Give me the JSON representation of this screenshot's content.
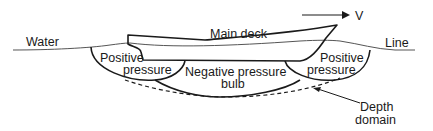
{
  "diagram": {
    "labels": {
      "water": "Water",
      "line": "Line",
      "main_deck": "Main deck",
      "velocity": "V",
      "positive_left_1": "Positive",
      "positive_left_2": "pressure",
      "positive_right_1": "Positive",
      "positive_right_2": "pressure",
      "negative_1": "Negative pressure",
      "negative_2": "bulb",
      "depth_1": "Depth",
      "depth_2": "domain"
    },
    "colors": {
      "stroke": "#1a1a1a",
      "water_line": "#444444",
      "background": "#ffffff"
    }
  }
}
